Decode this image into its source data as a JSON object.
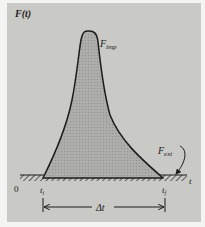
{
  "figure": {
    "y_axis_label": "F(t)",
    "x_axis_label": "t",
    "origin_label": "0",
    "impulse_curve_label": {
      "main": "F",
      "sub": "imp"
    },
    "external_force_label": {
      "main": "F",
      "sub": "ext"
    },
    "start_time_label": {
      "main": "t",
      "sub": "i"
    },
    "end_time_label": {
      "main": "t",
      "sub": "f"
    },
    "interval_label": "Δt"
  },
  "colors": {
    "background": "#f4f4f2",
    "panel": "#c9c9c6",
    "curve_fill": "#a9a9a6",
    "ink": "#1c1c1c"
  }
}
